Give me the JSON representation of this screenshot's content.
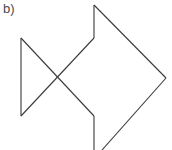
{
  "figure": {
    "label": "b)",
    "canvas": {
      "width": 172,
      "height": 150
    },
    "background_color": "#ffffff",
    "stroke_color": "#3a3a3a",
    "label_color": "#4a4a4a",
    "stroke_width": 1.1,
    "vertices": {
      "tail_top": [
        21,
        38
      ],
      "tail_bottom": [
        21,
        116
      ],
      "cross_center": [
        60,
        78
      ],
      "body_upper_left": [
        94,
        38
      ],
      "body_lower_left": [
        94,
        116
      ],
      "body_top": [
        94,
        5
      ],
      "body_right": [
        166,
        78
      ],
      "body_bottom": [
        94,
        150
      ],
      "body_bottom_right": [
        102,
        150
      ]
    },
    "paths": {
      "tail_vertical": "M 21 38 L 21 116",
      "diagonal_down_right": "M 21 38 L 94 116",
      "diagonal_up_right": "M 21 116 L 94 38",
      "body_upper_vertical": "M 94 38 L 94 5",
      "body_upper_diagonal": "M 94 5 L 166 78",
      "body_lower_diagonal": "M 166 78 L 102 150",
      "body_lower_vertical": "M 94 116 L 94 150"
    }
  }
}
